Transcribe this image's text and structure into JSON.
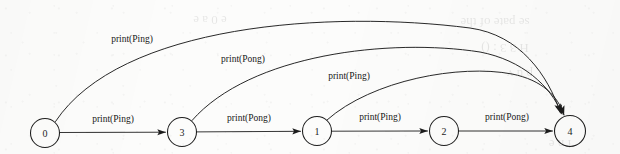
{
  "diagram": {
    "type": "state-transition-diagram",
    "background_color": "#fcfcfb",
    "stroke_color": "#1d1d1d",
    "nodes": [
      {
        "id": "n0",
        "label": "0",
        "cx": 45,
        "cy": 133,
        "r": 14.5
      },
      {
        "id": "n3",
        "label": "3",
        "cx": 182,
        "cy": 132,
        "r": 14.5
      },
      {
        "id": "n1",
        "label": "1",
        "cx": 317,
        "cy": 131,
        "r": 14.5
      },
      {
        "id": "n2",
        "label": "2",
        "cx": 444,
        "cy": 131,
        "r": 14.5
      },
      {
        "id": "n4",
        "label": "4",
        "cx": 570,
        "cy": 131,
        "r": 15.5
      }
    ],
    "edges": [
      {
        "id": "e-0-3",
        "from": "0",
        "to": "3",
        "label": "print(Ping)",
        "shape": "straight",
        "label_x": 113,
        "label_y": 122,
        "path": "M 60,132.5 L 165.5,132.2"
      },
      {
        "id": "e-3-1",
        "from": "3",
        "to": "1",
        "label": "print(Pong)",
        "shape": "straight",
        "label_x": 249,
        "label_y": 121,
        "path": "M 197,131.9 L 300.5,131.3"
      },
      {
        "id": "e-1-2",
        "from": "1",
        "to": "2",
        "label": "print(Ping)",
        "shape": "straight",
        "label_x": 380,
        "label_y": 120,
        "path": "M 332,131.2 L 427.5,131.0"
      },
      {
        "id": "e-2-4",
        "from": "2",
        "to": "4",
        "label": "print(Pong)",
        "shape": "straight",
        "label_x": 507,
        "label_y": 120,
        "path": "M 459,131.0 L 552.5,131.0"
      },
      {
        "id": "e-0-4",
        "from": "0",
        "to": "4",
        "label": "print(Ping)",
        "shape": "arc",
        "label_x": 132,
        "label_y": 42,
        "path": "M 55.5,121.5 C 120,24 330,10 470,28 C 520,35 548,75 560.5,113"
      },
      {
        "id": "e-3-4",
        "from": "3",
        "to": "4",
        "label": "print(Pong)",
        "shape": "arc",
        "label_x": 243,
        "label_y": 62,
        "path": "M 192,120.5 C 250,54 390,38 480,52 C 522,60 551,86 562,114"
      },
      {
        "id": "e-1-4",
        "from": "1",
        "to": "4",
        "label": "print(Ping)",
        "shape": "arc",
        "label_x": 349,
        "label_y": 79,
        "path": "M 327,120 C 372,80 460,64 512,74 C 542,80 558,96 564,115"
      }
    ],
    "ghost_text": [
      {
        "text": "se  pate  of  the",
        "x": 495,
        "y": 18
      },
      {
        "text": "H  3 3  :  ()",
        "x": 505,
        "y": 44
      },
      {
        "text": "p  u  v",
        "x": 520,
        "y": 70
      },
      {
        "text": "e   0  a  e",
        "x": 210,
        "y": 16
      },
      {
        "text": "i  n  e",
        "x": 560,
        "y": 140
      }
    ]
  }
}
